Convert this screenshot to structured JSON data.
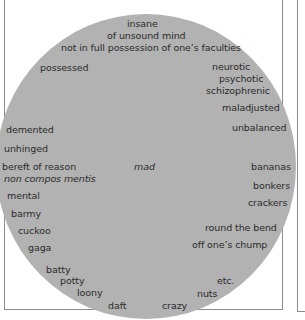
{
  "diagram": {
    "type": "word-cloud-circle",
    "colors": {
      "circle_fill": "#b2b2b2",
      "text": "#2b2b2b",
      "border": "#8c8c8c",
      "background": "#ffffff"
    },
    "center_term": "mad",
    "terms": [
      {
        "text": "insane",
        "style": "normal"
      },
      {
        "text": "of unsound mind",
        "style": "normal"
      },
      {
        "text": "not in full possession of one’s faculties",
        "style": "normal"
      },
      {
        "text": "possessed",
        "style": "normal"
      },
      {
        "text": "neurotic",
        "style": "normal"
      },
      {
        "text": "psychotic",
        "style": "normal"
      },
      {
        "text": "schizophrenic",
        "style": "normal"
      },
      {
        "text": "maladjusted",
        "style": "normal"
      },
      {
        "text": "unbalanced",
        "style": "normal"
      },
      {
        "text": "demented",
        "style": "normal"
      },
      {
        "text": "unhinged",
        "style": "normal"
      },
      {
        "text": "bereft of reason",
        "style": "normal"
      },
      {
        "text": "non compos mentis",
        "style": "italic"
      },
      {
        "text": "mad",
        "style": "italic"
      },
      {
        "text": "bananas",
        "style": "normal"
      },
      {
        "text": "bonkers",
        "style": "normal"
      },
      {
        "text": "crackers",
        "style": "normal"
      },
      {
        "text": "mental",
        "style": "normal"
      },
      {
        "text": "barmy",
        "style": "normal"
      },
      {
        "text": "cuckoo",
        "style": "normal"
      },
      {
        "text": "gaga",
        "style": "normal"
      },
      {
        "text": "round the bend",
        "style": "normal"
      },
      {
        "text": "off one’s chump",
        "style": "normal"
      },
      {
        "text": "batty",
        "style": "normal"
      },
      {
        "text": "potty",
        "style": "normal"
      },
      {
        "text": "etc.",
        "style": "normal"
      },
      {
        "text": "loony",
        "style": "normal"
      },
      {
        "text": "nuts",
        "style": "normal"
      },
      {
        "text": "daft",
        "style": "normal"
      },
      {
        "text": "crazy",
        "style": "normal"
      }
    ]
  }
}
